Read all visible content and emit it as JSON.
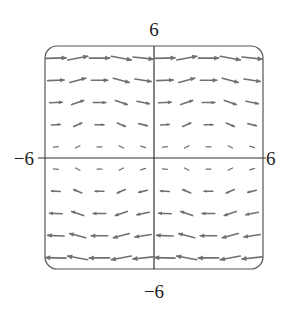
{
  "chart_data": {
    "type": "vector_field",
    "title": "",
    "xlabel": "",
    "ylabel": "",
    "xlim": [
      -6,
      6
    ],
    "ylim": [
      -6,
      6
    ],
    "tick_labels": {
      "x_min": "−6",
      "x_max": "6",
      "y_min": "−6",
      "y_max": "6"
    },
    "grid": false,
    "field_description": "F(x,y) = (y, g(x)) — horizontal component grows with y, vertical component periodic in x",
    "columns_x": [
      -5.4,
      -4.2,
      -3.0,
      -1.8,
      -0.6,
      0.6,
      1.8,
      3.0,
      4.2,
      5.4
    ],
    "rows_y": [
      5.4,
      4.2,
      3.0,
      1.8,
      0.6,
      -0.6,
      -1.8,
      -3.0,
      -4.2,
      -5.4
    ],
    "column_slope_pattern": [
      0.05,
      0.35,
      0.0,
      -0.35,
      -0.2,
      0.05,
      0.35,
      0.0,
      -0.35,
      -0.2
    ],
    "colors": {
      "arrow": "#707070",
      "axis": "#333333",
      "frame": "#555555"
    }
  }
}
